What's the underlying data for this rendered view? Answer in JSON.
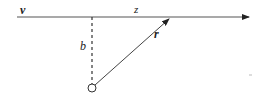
{
  "diagram": {
    "type": "vector geometry (impact parameter)",
    "labels": {
      "velocity": "v",
      "z_axis": "z",
      "impact_parameter": "b",
      "position_vector": "r"
    },
    "elements": {
      "axis_line": {
        "x1": 17,
        "y1": 17,
        "x2": 249,
        "y2": 17,
        "arrow": true,
        "style": "solid"
      },
      "perpendicular": {
        "x1": 92,
        "y1": 17,
        "x2": 92,
        "y2": 84,
        "style": "dashed"
      },
      "origin_point": {
        "cx": 92,
        "cy": 88,
        "r": 4,
        "fill": "none"
      },
      "r_vector": {
        "x1": 95,
        "y1": 85,
        "x2": 170,
        "y2": 18,
        "arrow": true,
        "style": "solid"
      }
    },
    "colors": {
      "stroke": "#333333",
      "text": "#222222",
      "background": "#ffffff"
    }
  }
}
